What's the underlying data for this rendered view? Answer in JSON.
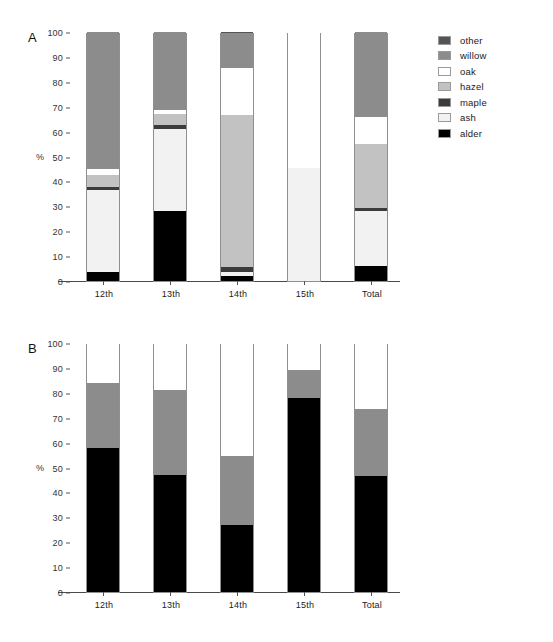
{
  "figure": {
    "background": "#ffffff",
    "panels": [
      {
        "letter": "A",
        "ylabel": "%",
        "categories": [
          "12th",
          "13th",
          "14th",
          "15th",
          "Total"
        ],
        "yticks": [
          "0",
          "10",
          "20",
          "30",
          "40",
          "50",
          "60",
          "70",
          "80",
          "90",
          "100"
        ]
      },
      {
        "letter": "B",
        "ylabel": "%",
        "categories": [
          "12th",
          "13th",
          "14th",
          "15th",
          "Total"
        ],
        "yticks": [
          "0",
          "10",
          "20",
          "30",
          "40",
          "50",
          "60",
          "70",
          "80",
          "90",
          "100"
        ]
      }
    ]
  },
  "legend_a": {
    "items": [
      {
        "label": "other",
        "color": "#545454"
      },
      {
        "label": "willow",
        "color": "#8c8c8c"
      },
      {
        "label": "oak",
        "color": "#ffffff"
      },
      {
        "label": "hazel",
        "color": "#c2c2c2"
      },
      {
        "label": "maple",
        "color": "#3b3b3b"
      },
      {
        "label": "ash",
        "color": "#f2f2f2"
      },
      {
        "label": "alder",
        "color": "#000000"
      }
    ]
  },
  "legend_b": {
    "items": [
      {
        "label": "Summer",
        "color": "#ffffff"
      },
      {
        "label": "Spring",
        "color": "#8c8c8c"
      },
      {
        "label": "Autumn/winter",
        "color": "#000000"
      }
    ]
  },
  "chart_data": [
    {
      "type": "bar",
      "stacked": true,
      "panel": "A",
      "title": "",
      "xlabel": "",
      "ylabel": "%",
      "ylim": [
        0,
        100
      ],
      "ytick_step": 10,
      "grid": false,
      "legend_position": "right",
      "categories": [
        "12th",
        "13th",
        "14th",
        "15th",
        "Total"
      ],
      "series": [
        {
          "name": "alder",
          "color": "#000000",
          "values": [
            3.5,
            28.0,
            2.0,
            0.0,
            6.0
          ]
        },
        {
          "name": "ash",
          "color": "#f2f2f2",
          "values": [
            33.0,
            33.0,
            1.5,
            45.5,
            22.0
          ]
        },
        {
          "name": "maple",
          "color": "#3b3b3b",
          "values": [
            1.2,
            1.5,
            2.0,
            0.0,
            1.5
          ]
        },
        {
          "name": "hazel",
          "color": "#c2c2c2",
          "values": [
            4.8,
            4.5,
            61.0,
            0.0,
            25.5
          ]
        },
        {
          "name": "oak",
          "color": "#ffffff",
          "values": [
            2.5,
            1.5,
            19.0,
            54.5,
            11.0
          ]
        },
        {
          "name": "willow",
          "color": "#8c8c8c",
          "values": [
            55.0,
            31.5,
            14.0,
            0.0,
            34.0
          ]
        },
        {
          "name": "other",
          "color": "#545454",
          "values": [
            0.0,
            0.0,
            0.5,
            0.0,
            0.0
          ]
        }
      ],
      "cumulative_tops": {
        "12th": {
          "alder": 3.5,
          "ash": 36.5,
          "maple": 37.7,
          "hazel": 42.5,
          "oak": 45.0,
          "willow": 100.0,
          "other": 100.0
        },
        "13th": {
          "alder": 28.0,
          "ash": 61.0,
          "maple": 62.5,
          "hazel": 67.0,
          "oak": 68.5,
          "willow": 100.0,
          "other": 100.0
        },
        "14th": {
          "alder": 2.0,
          "ash": 3.5,
          "maple": 5.5,
          "hazel": 66.5,
          "oak": 85.5,
          "willow": 99.5,
          "other": 100.0
        },
        "15th": {
          "alder": 0.0,
          "ash": 45.5,
          "maple": 45.5,
          "hazel": 45.5,
          "oak": 100.0,
          "willow": 100.0,
          "other": 100.0
        },
        "Total": {
          "alder": 6.0,
          "ash": 28.0,
          "maple": 29.5,
          "hazel": 55.0,
          "oak": 66.0,
          "willow": 100.0,
          "other": 100.0
        }
      }
    },
    {
      "type": "bar",
      "stacked": true,
      "panel": "B",
      "title": "",
      "xlabel": "",
      "ylabel": "%",
      "ylim": [
        0,
        100
      ],
      "ytick_step": 10,
      "grid": false,
      "legend_position": "right",
      "categories": [
        "12th",
        "13th",
        "14th",
        "15th",
        "Total"
      ],
      "series": [
        {
          "name": "Autumn/winter",
          "color": "#000000",
          "values": [
            58.0,
            47.0,
            27.0,
            78.0,
            46.5
          ]
        },
        {
          "name": "Spring",
          "color": "#8c8c8c",
          "values": [
            26.0,
            34.0,
            27.5,
            11.0,
            27.0
          ]
        },
        {
          "name": "Summer",
          "color": "#ffffff",
          "values": [
            16.0,
            19.0,
            45.5,
            11.0,
            26.5
          ]
        }
      ],
      "cumulative_tops": {
        "12th": {
          "autumn_winter": 58.0,
          "spring": 84.0,
          "summer": 100.0
        },
        "13th": {
          "autumn_winter": 47.0,
          "spring": 81.0,
          "summer": 100.0
        },
        "14th": {
          "autumn_winter": 27.0,
          "spring": 54.5,
          "summer": 100.0
        },
        "15th": {
          "autumn_winter": 78.0,
          "spring": 89.0,
          "summer": 100.0
        },
        "Total": {
          "autumn_winter": 46.5,
          "spring": 73.5,
          "summer": 100.0
        }
      }
    }
  ]
}
